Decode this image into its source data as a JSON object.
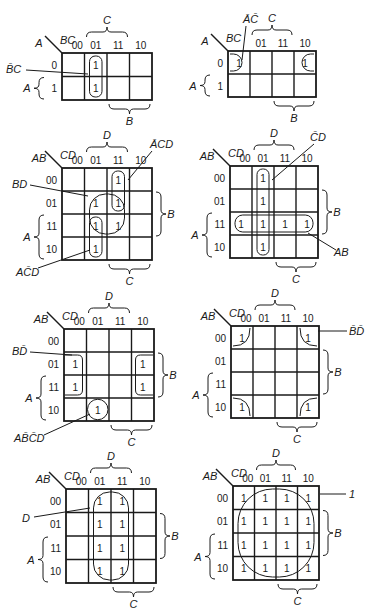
{
  "figure": {
    "maps": [
      {
        "id": "map1",
        "x": 62,
        "y": 53,
        "cols": 4,
        "rows": 2,
        "cw": 22.5,
        "ch": 23.5,
        "row_var": "A",
        "col_var": "BC",
        "col_labels": [
          "00",
          "01",
          "11",
          "10"
        ],
        "row_labels": [
          "0",
          "1"
        ],
        "ones": [
          [
            0,
            1
          ],
          [
            1,
            1
          ]
        ],
        "bracket_top": {
          "label": "C",
          "from": 1,
          "to": 3
        },
        "bracket_bottom": {
          "label": "B",
          "from": 2,
          "to": 4
        },
        "bracket_left": {
          "label": "A",
          "from": 1,
          "to": 2
        },
        "bracket_right": null,
        "groups": [
          {
            "type": "rect",
            "r0": 0,
            "c0": 1,
            "r1": 1,
            "c1": 1
          }
        ],
        "annotations": [
          {
            "label": "B̄C",
            "tx": 6,
            "ty": 73,
            "lx1": 26,
            "ly1": 70,
            "lx2": 88,
            "ly2": 74
          }
        ]
      },
      {
        "id": "map2",
        "x": 228,
        "y": 51,
        "cols": 4,
        "rows": 2,
        "cw": 22,
        "ch": 23,
        "row_var": "A",
        "col_var": "BC",
        "col_labels": [
          "",
          "01",
          "11",
          "10"
        ],
        "row_labels": [
          "0",
          "1"
        ],
        "ones": [
          [
            0,
            0
          ],
          [
            0,
            3
          ]
        ],
        "bracket_top": {
          "label": "C",
          "from": 1,
          "to": 3
        },
        "bracket_bottom": {
          "label": "B",
          "from": 2,
          "to": 4
        },
        "bracket_left": {
          "label": "A",
          "from": 1,
          "to": 2
        },
        "bracket_right": null,
        "groups": [
          {
            "type": "edge-left",
            "r": 0,
            "c": 0
          },
          {
            "type": "edge-right",
            "r": 0,
            "c": 3
          }
        ],
        "annotations": [
          {
            "label": "ĀC̄",
            "tx": 243,
            "ty": 23,
            "lx1": 246,
            "ly1": 26,
            "lx2": 242,
            "ly2": 60
          }
        ]
      },
      {
        "id": "map3",
        "x": 62,
        "y": 168,
        "cols": 4,
        "rows": 4,
        "cw": 22.5,
        "ch": 23,
        "row_var": "AB",
        "col_var": "CD",
        "col_labels": [
          "00",
          "01",
          "11",
          "10"
        ],
        "row_labels": [
          "00",
          "01",
          "11",
          "10"
        ],
        "ones": [
          [
            0,
            2
          ],
          [
            1,
            1
          ],
          [
            1,
            2
          ],
          [
            2,
            1
          ],
          [
            2,
            2
          ],
          [
            3,
            1
          ]
        ],
        "bracket_top": {
          "label": "D",
          "from": 1,
          "to": 3
        },
        "bracket_bottom": {
          "label": "C",
          "from": 2,
          "to": 4
        },
        "bracket_left": {
          "label": "A",
          "from": 2,
          "to": 4
        },
        "bracket_right": {
          "label": "B",
          "from": 1,
          "to": 3
        },
        "groups": [
          {
            "type": "rect",
            "r0": 0,
            "c0": 2,
            "r1": 1,
            "c1": 2
          },
          {
            "type": "rect",
            "r0": 1,
            "c0": 1,
            "r1": 2,
            "c1": 2
          },
          {
            "type": "rect",
            "r0": 2,
            "c0": 1,
            "r1": 3,
            "c1": 1
          }
        ],
        "annotations": [
          {
            "label": "ĀCD",
            "tx": 150,
            "ty": 148,
            "lx1": 152,
            "ly1": 151,
            "lx2": 128,
            "ly2": 180
          },
          {
            "label": "BD",
            "tx": 12,
            "ty": 188,
            "lx1": 30,
            "ly1": 185,
            "lx2": 88,
            "ly2": 196
          },
          {
            "label": "AC̄D",
            "tx": 16,
            "ty": 276,
            "lx1": 38,
            "ly1": 268,
            "lx2": 90,
            "ly2": 250
          }
        ]
      },
      {
        "id": "map4",
        "x": 230,
        "y": 166,
        "cols": 4,
        "rows": 4,
        "cw": 22,
        "ch": 23,
        "row_var": "AB",
        "col_var": "CD",
        "col_labels": [
          "00",
          "01",
          "11",
          "10"
        ],
        "row_labels": [
          "00",
          "01",
          "11",
          "10"
        ],
        "ones": [
          [
            0,
            1
          ],
          [
            1,
            1
          ],
          [
            2,
            0
          ],
          [
            2,
            1
          ],
          [
            2,
            2
          ],
          [
            2,
            3
          ],
          [
            3,
            1
          ]
        ],
        "bracket_top": {
          "label": "D",
          "from": 1,
          "to": 3
        },
        "bracket_bottom": {
          "label": "C",
          "from": 2,
          "to": 4
        },
        "bracket_left": {
          "label": "A",
          "from": 2,
          "to": 4
        },
        "bracket_right": {
          "label": "B",
          "from": 1,
          "to": 3
        },
        "groups": [
          {
            "type": "rect",
            "r0": 0,
            "c0": 1,
            "r1": 3,
            "c1": 1
          },
          {
            "type": "rect",
            "r0": 2,
            "c0": 0,
            "r1": 2,
            "c1": 3
          }
        ],
        "annotations": [
          {
            "label": "C̄D",
            "tx": 310,
            "ty": 141,
            "lx1": 314,
            "ly1": 144,
            "lx2": 272,
            "ly2": 180
          },
          {
            "label": "AB",
            "tx": 334,
            "ty": 256,
            "lx1": 336,
            "ly1": 250,
            "lx2": 308,
            "ly2": 233
          }
        ]
      },
      {
        "id": "map5",
        "x": 64,
        "y": 329,
        "cols": 4,
        "rows": 4,
        "cw": 22.5,
        "ch": 23,
        "row_var": "AB",
        "col_var": "CD",
        "col_labels": [
          "00",
          "01",
          "11",
          "10"
        ],
        "row_labels": [
          "00",
          "01",
          "11",
          "10"
        ],
        "ones": [
          [
            1,
            0
          ],
          [
            2,
            0
          ],
          [
            1,
            3
          ],
          [
            2,
            3
          ],
          [
            3,
            1
          ]
        ],
        "bracket_top": {
          "label": "D",
          "from": 1,
          "to": 3
        },
        "bracket_bottom": {
          "label": "C",
          "from": 2,
          "to": 4
        },
        "bracket_left": {
          "label": "A",
          "from": 2,
          "to": 4
        },
        "bracket_right": {
          "label": "B",
          "from": 1,
          "to": 3
        },
        "groups": [
          {
            "type": "edge-left-v",
            "r0": 1,
            "r1": 2,
            "c": 0
          },
          {
            "type": "edge-right-v",
            "r0": 1,
            "r1": 2,
            "c": 3
          },
          {
            "type": "circle",
            "r": 3,
            "c": 1
          }
        ],
        "annotations": [
          {
            "label": "BD̄",
            "tx": 12,
            "ty": 355,
            "lx1": 30,
            "ly1": 352,
            "lx2": 72,
            "ly2": 355
          },
          {
            "label": "AB̄C̄D",
            "tx": 14,
            "ty": 442,
            "lx1": 44,
            "ly1": 435,
            "lx2": 90,
            "ly2": 414
          }
        ]
      },
      {
        "id": "map6",
        "x": 231,
        "y": 326,
        "cols": 4,
        "rows": 4,
        "cw": 22,
        "ch": 23,
        "row_var": "AB",
        "col_var": "CD",
        "col_labels": [
          "00",
          "01",
          "11",
          "10"
        ],
        "row_labels": [
          "00",
          "01",
          "11",
          "10"
        ],
        "ones": [
          [
            0,
            0
          ],
          [
            0,
            3
          ],
          [
            3,
            0
          ],
          [
            3,
            3
          ]
        ],
        "bracket_top": {
          "label": "D",
          "from": 1,
          "to": 3
        },
        "bracket_bottom": {
          "label": "C",
          "from": 2,
          "to": 4
        },
        "bracket_left": {
          "label": "A",
          "from": 2,
          "to": 4
        },
        "bracket_right": {
          "label": "B",
          "from": 1,
          "to": 3
        },
        "groups": [
          {
            "type": "corner-tl",
            "r": 0,
            "c": 0
          },
          {
            "type": "corner-tr",
            "r": 0,
            "c": 3
          },
          {
            "type": "corner-bl",
            "r": 3,
            "c": 0
          },
          {
            "type": "corner-br",
            "r": 3,
            "c": 3
          }
        ],
        "annotations": [
          {
            "label": "B̄D̄",
            "tx": 349,
            "ty": 335,
            "lx1": 318,
            "ly1": 331,
            "lx2": 347,
            "ly2": 331
          }
        ]
      },
      {
        "id": "map7",
        "x": 66,
        "y": 489,
        "cols": 4,
        "rows": 4,
        "cw": 22.5,
        "ch": 23.5,
        "row_var": "AB",
        "col_var": "CD",
        "col_labels": [
          "00",
          "01",
          "11",
          "10"
        ],
        "row_labels": [
          "00",
          "01",
          "11",
          "10"
        ],
        "ones": [
          [
            0,
            1
          ],
          [
            0,
            2
          ],
          [
            1,
            1
          ],
          [
            1,
            2
          ],
          [
            2,
            1
          ],
          [
            2,
            2
          ],
          [
            3,
            1
          ],
          [
            3,
            2
          ]
        ],
        "bracket_top": {
          "label": "D",
          "from": 1,
          "to": 3
        },
        "bracket_bottom": {
          "label": "C",
          "from": 2,
          "to": 4
        },
        "bracket_left": {
          "label": "A",
          "from": 2,
          "to": 4
        },
        "bracket_right": {
          "label": "B",
          "from": 1,
          "to": 3
        },
        "groups": [
          {
            "type": "rect",
            "r0": 0,
            "c0": 1,
            "r1": 3,
            "c1": 2
          }
        ],
        "annotations": [
          {
            "label": "D",
            "tx": 22,
            "ty": 522,
            "lx1": 34,
            "ly1": 517,
            "lx2": 90,
            "ly2": 508
          }
        ]
      },
      {
        "id": "map8",
        "x": 233,
        "y": 486,
        "cols": 4,
        "rows": 4,
        "cw": 21.5,
        "ch": 23.5,
        "row_var": "AB",
        "col_var": "CD",
        "col_labels": [
          "00",
          "01",
          "11",
          "10"
        ],
        "row_labels": [
          "00",
          "01",
          "11",
          "10"
        ],
        "ones": [
          [
            0,
            0
          ],
          [
            0,
            1
          ],
          [
            0,
            2
          ],
          [
            0,
            3
          ],
          [
            1,
            0
          ],
          [
            1,
            1
          ],
          [
            1,
            2
          ],
          [
            1,
            3
          ],
          [
            2,
            0
          ],
          [
            2,
            1
          ],
          [
            2,
            2
          ],
          [
            2,
            3
          ],
          [
            3,
            0
          ],
          [
            3,
            1
          ],
          [
            3,
            2
          ],
          [
            3,
            3
          ]
        ],
        "bracket_top": {
          "label": "D",
          "from": 1,
          "to": 3
        },
        "bracket_bottom": {
          "label": "C",
          "from": 2,
          "to": 4
        },
        "bracket_left": {
          "label": "A",
          "from": 2,
          "to": 4
        },
        "bracket_right": {
          "label": "B",
          "from": 1,
          "to": 3
        },
        "groups": [
          {
            "type": "rect",
            "r0": 0,
            "c0": 0,
            "r1": 3,
            "c1": 3
          }
        ],
        "annotations": [
          {
            "label": "1",
            "tx": 349,
            "ty": 498,
            "lx1": 320,
            "ly1": 494,
            "lx2": 346,
            "ly2": 494
          }
        ]
      }
    ],
    "cell_value": "1"
  }
}
